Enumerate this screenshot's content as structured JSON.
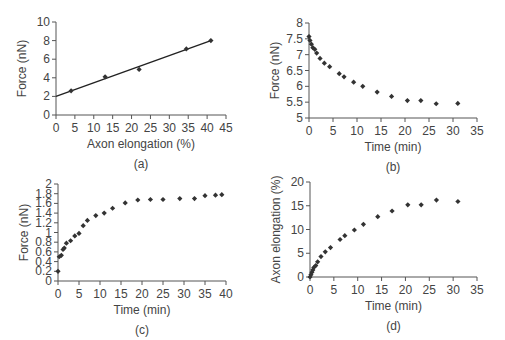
{
  "figure": {
    "panels": [
      "(a)",
      "(b)",
      "(c)",
      "(d)"
    ]
  },
  "chart_data": [
    {
      "id": "a",
      "type": "scatter",
      "panel_label": "(a)",
      "title": "",
      "xlabel": "Axon elongation (%)",
      "ylabel": "Force (nN)",
      "xlim": [
        0,
        45
      ],
      "ylim": [
        0,
        10
      ],
      "xticks": [
        0,
        5,
        10,
        15,
        20,
        25,
        30,
        35,
        40,
        45
      ],
      "yticks": [
        0,
        2,
        4,
        6,
        8,
        10
      ],
      "grid": false,
      "x": [
        4,
        13,
        22,
        34.5,
        41
      ],
      "y": [
        2.6,
        4.1,
        4.9,
        7.1,
        8.0
      ],
      "trendline": {
        "x": [
          0,
          41
        ],
        "y": [
          2.0,
          8.0
        ]
      },
      "marker": "diamond",
      "color": "#333333",
      "box": {
        "left": 56,
        "right": 226,
        "top": 22,
        "bottom": 115
      }
    },
    {
      "id": "b",
      "type": "scatter",
      "panel_label": "(b)",
      "title": "",
      "xlabel": "Time (min)",
      "ylabel": "Force (nN)",
      "xlim": [
        0,
        35
      ],
      "ylim": [
        5,
        8
      ],
      "xticks": [
        0,
        5,
        10,
        15,
        20,
        25,
        30,
        35
      ],
      "yticks": [
        5,
        5.5,
        6,
        6.5,
        7,
        7.5,
        8
      ],
      "grid": false,
      "x": [
        0,
        0.2,
        0.5,
        0.8,
        1.2,
        1.6,
        2.3,
        3.2,
        4.3,
        6.3,
        7.3,
        9.3,
        11.2,
        14.2,
        17.2,
        20.5,
        23.3,
        26.5,
        31
      ],
      "y": [
        7.57,
        7.45,
        7.33,
        7.22,
        7.17,
        7.05,
        6.88,
        6.73,
        6.62,
        6.4,
        6.3,
        6.13,
        6.0,
        5.82,
        5.68,
        5.55,
        5.55,
        5.45,
        5.46
      ],
      "marker": "diamond",
      "color": "#333333",
      "box": {
        "left": 309,
        "right": 477,
        "top": 23,
        "bottom": 118
      }
    },
    {
      "id": "c",
      "type": "scatter",
      "panel_label": "(c)",
      "title": "",
      "xlabel": "Time (min)",
      "ylabel": "Force (nN)",
      "xlim": [
        0,
        40
      ],
      "ylim": [
        0,
        2
      ],
      "xticks": [
        0,
        5,
        10,
        15,
        20,
        25,
        30,
        35,
        40
      ],
      "yticks": [
        0,
        0.2,
        0.4,
        0.6,
        0.8,
        1,
        1.2,
        1.4,
        1.6,
        1.8,
        2
      ],
      "grid": false,
      "x": [
        0,
        0.3,
        0.8,
        1.2,
        1.5,
        2.0,
        3.0,
        4.0,
        5.0,
        6.0,
        7.0,
        9.0,
        11.0,
        13.0,
        16.0,
        19.0,
        22.0,
        25.0,
        29.0,
        32.5,
        35.0,
        37.5,
        39.0
      ],
      "y": [
        0.2,
        0.5,
        0.53,
        0.65,
        0.68,
        0.78,
        0.83,
        0.93,
        0.98,
        1.14,
        1.25,
        1.35,
        1.4,
        1.5,
        1.61,
        1.67,
        1.68,
        1.68,
        1.7,
        1.7,
        1.76,
        1.77,
        1.78
      ],
      "marker": "diamond",
      "color": "#333333",
      "box": {
        "left": 58,
        "right": 226,
        "top": 184,
        "bottom": 281
      }
    },
    {
      "id": "d",
      "type": "scatter",
      "panel_label": "(d)",
      "title": "",
      "xlabel": "Time (min)",
      "ylabel": "Axon elongation (%)",
      "xlim": [
        0,
        35
      ],
      "ylim": [
        0,
        20
      ],
      "xticks": [
        0,
        5,
        10,
        15,
        20,
        25,
        30,
        35
      ],
      "yticks": [
        0,
        5,
        10,
        15,
        20
      ],
      "grid": false,
      "x": [
        0,
        0.2,
        0.4,
        0.6,
        0.8,
        1.2,
        1.6,
        2.3,
        3.2,
        4.3,
        6.3,
        7.3,
        9.3,
        11.2,
        14.2,
        17.2,
        20.5,
        23.3,
        26.5,
        31
      ],
      "y": [
        0,
        0.5,
        1.0,
        1.5,
        2.0,
        2.4,
        3.2,
        4.3,
        5.3,
        6.2,
        7.9,
        8.7,
        9.9,
        11.1,
        12.7,
        13.9,
        15.2,
        15.2,
        16.2,
        15.9
      ],
      "marker": "diamond",
      "color": "#333333",
      "box": {
        "left": 310,
        "right": 477,
        "top": 182,
        "bottom": 277
      }
    }
  ]
}
